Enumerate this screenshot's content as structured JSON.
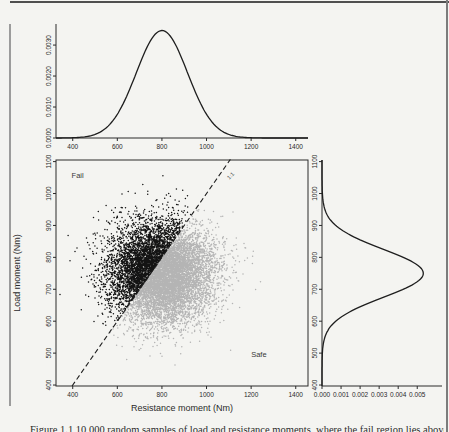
{
  "figure": {
    "caption_partial": "Figure 1.1  10,000 random samples of load and resistance moments, where the fail region lies above the 1:1 line.",
    "colors": {
      "curve": "#1e1e1e",
      "axis": "#2a2a2a",
      "text": "#2a2a2a",
      "fail_points": "#141414",
      "safe_points": "#b4b4b4",
      "page_bg": "#f4f4f1",
      "rule_gray": "#8c8c8c"
    }
  },
  "chart_data": [
    {
      "id": "top_density",
      "type": "line",
      "description": "Marginal probability density of resistance moment",
      "xlabel": "",
      "ylabel": "",
      "x_ticks": [
        400,
        600,
        800,
        1000,
        1200,
        1400
      ],
      "x_tick_labels": [
        "400",
        "600",
        "800",
        "1000",
        "1200",
        "1400"
      ],
      "y_ticks": [
        0,
        0.001,
        0.002,
        0.003
      ],
      "y_tick_labels": [
        "0.0000",
        "0.0010",
        "0.0020",
        "0.0030"
      ],
      "xlim": [
        325,
        1455
      ],
      "ylim": [
        0,
        0.00368
      ],
      "distribution": {
        "kind": "normal",
        "mean": 800,
        "sd": 115
      }
    },
    {
      "id": "scatter",
      "type": "scatter",
      "description": "Monte Carlo samples of load moment vs resistance moment",
      "xlabel": "Resistance moment (Nm)",
      "ylabel": "Load moment (Nm)",
      "x_ticks": [
        400,
        600,
        800,
        1000,
        1200,
        1400
      ],
      "x_tick_labels": [
        "400",
        "600",
        "800",
        "1000",
        "1200",
        "1400"
      ],
      "y_ticks": [
        400,
        500,
        600,
        700,
        800,
        900,
        1000,
        1100
      ],
      "y_tick_labels": [
        "400",
        "500",
        "600",
        "700",
        "800",
        "900",
        "1000",
        "1100"
      ],
      "xlim": [
        325,
        1455
      ],
      "ylim": [
        397,
        1105
      ],
      "n_points": 10000,
      "seed": 1337,
      "x_distribution": {
        "kind": "normal",
        "mean": 800,
        "sd": 115
      },
      "y_distribution": {
        "kind": "normal",
        "mean": 750,
        "sd": 75
      },
      "line_1to1": {
        "label": "1:1",
        "from": [
          397,
          397
        ],
        "to": [
          1107,
          1107
        ],
        "dashed": true
      },
      "region_labels": [
        {
          "text": "Fail",
          "x": 395,
          "y": 1048
        },
        {
          "text": "Safe",
          "x": 1200,
          "y": 488
        }
      ]
    },
    {
      "id": "right_density",
      "type": "line",
      "description": "Marginal probability density of load moment (rotated)",
      "orientation": "horizontal",
      "xlabel": "",
      "ylabel": "",
      "x_ticks": [
        0,
        0.001,
        0.002,
        0.003,
        0.004,
        0.005
      ],
      "x_tick_labels": [
        "0.000",
        "0.001",
        "0.002",
        "0.003",
        "0.004",
        "0.005"
      ],
      "y_ticks": [
        400,
        500,
        600,
        700,
        800,
        900,
        1000,
        1100
      ],
      "y_tick_labels": [
        "400",
        "500",
        "600",
        "700",
        "800",
        "900",
        "1000",
        "1100"
      ],
      "xlim": [
        0,
        0.0063
      ],
      "ylim": [
        397,
        1105
      ],
      "distribution": {
        "kind": "normal",
        "mean": 750,
        "sd": 75
      }
    }
  ]
}
